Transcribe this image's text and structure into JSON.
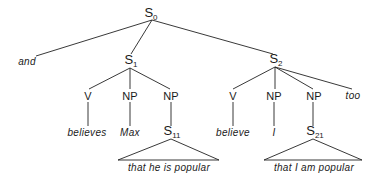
{
  "diagram": {
    "type": "syntax-tree",
    "nodes": {
      "s0": {
        "base": "S",
        "sub": "0",
        "x": 151,
        "y": 14
      },
      "and": {
        "label": "and",
        "x": 27,
        "y": 62
      },
      "s1": {
        "base": "S",
        "sub": "1",
        "x": 131,
        "y": 62
      },
      "s2": {
        "base": "S",
        "sub": "2",
        "x": 276,
        "y": 62
      },
      "s1_v": {
        "label": "V",
        "x": 88,
        "y": 96
      },
      "s1_np1": {
        "label": "NP",
        "x": 130,
        "y": 96
      },
      "s1_np2": {
        "label": "NP",
        "x": 171,
        "y": 96
      },
      "s2_v": {
        "label": "V",
        "x": 233,
        "y": 96
      },
      "s2_np1": {
        "label": "NP",
        "x": 274,
        "y": 96
      },
      "s2_np2": {
        "label": "NP",
        "x": 314,
        "y": 96
      },
      "too": {
        "label": "too",
        "x": 353,
        "y": 96
      },
      "believes": {
        "label": "believes",
        "x": 87,
        "y": 133
      },
      "max": {
        "label": "Max",
        "x": 130,
        "y": 133
      },
      "s11": {
        "base": "S",
        "sub": "11",
        "x": 172,
        "y": 133
      },
      "believe": {
        "label": "believe",
        "x": 233,
        "y": 133
      },
      "i": {
        "label": "I",
        "x": 274,
        "y": 133
      },
      "s21": {
        "base": "S",
        "sub": "21",
        "x": 315,
        "y": 133
      },
      "s11_text": {
        "label": "that he is popular",
        "x": 169,
        "y": 168
      },
      "s21_text": {
        "label": "that I am popular",
        "x": 314,
        "y": 168
      }
    },
    "edges": [
      [
        "s0",
        "and"
      ],
      [
        "s0",
        "s1"
      ],
      [
        "s0",
        "s2"
      ],
      [
        "s1",
        "s1_v"
      ],
      [
        "s1",
        "s1_np1"
      ],
      [
        "s1",
        "s1_np2"
      ],
      [
        "s2",
        "s2_v"
      ],
      [
        "s2",
        "s2_np1"
      ],
      [
        "s2",
        "s2_np2"
      ],
      [
        "s2",
        "too"
      ],
      [
        "s1_v",
        "believes"
      ],
      [
        "s1_np1",
        "max"
      ],
      [
        "s1_np2",
        "s11"
      ],
      [
        "s2_v",
        "believe"
      ],
      [
        "s2_np1",
        "i"
      ],
      [
        "s2_np2",
        "s21"
      ]
    ],
    "triangles": [
      {
        "apex": "s11",
        "left": 118,
        "right": 219,
        "base_y": 160
      },
      {
        "apex": "s21",
        "left": 264,
        "right": 362,
        "base_y": 160
      }
    ],
    "line_color": "#222222"
  }
}
